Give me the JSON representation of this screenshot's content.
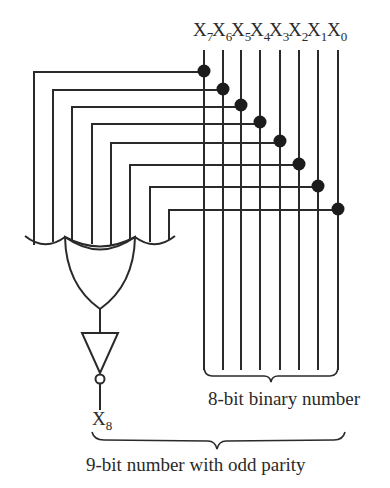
{
  "diagram": {
    "inputs": [
      {
        "name": "X",
        "sub": "7"
      },
      {
        "name": "X",
        "sub": "6"
      },
      {
        "name": "X",
        "sub": "5"
      },
      {
        "name": "X",
        "sub": "4"
      },
      {
        "name": "X",
        "sub": "3"
      },
      {
        "name": "X",
        "sub": "2"
      },
      {
        "name": "X",
        "sub": "1"
      },
      {
        "name": "X",
        "sub": "0"
      }
    ],
    "gate": "XOR",
    "inverter": "NOT",
    "output": {
      "name": "X",
      "sub": "8"
    },
    "labels": {
      "binary_number": "8-bit binary number",
      "parity_number": "9-bit number with odd parity"
    },
    "colors": {
      "line": "#2a2a2a",
      "background": "#ffffff"
    }
  }
}
